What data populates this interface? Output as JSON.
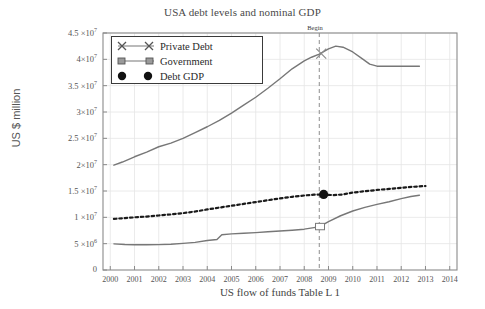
{
  "chart_data": {
    "type": "line",
    "title": "USA debt levels and nominal GDP",
    "xlabel": "US flow of funds Table L 1",
    "ylabel": "US $ million",
    "xlim": [
      1999.7,
      2014.3
    ],
    "ylim": [
      0,
      45000000
    ],
    "grid": true,
    "legend_position": "upper-left",
    "ytick_labels": [
      {
        "value": 45000000,
        "mantissa": "4.5 ×10",
        "exponent": "7"
      },
      {
        "value": 40000000,
        "mantissa": "4×10",
        "exponent": "7"
      },
      {
        "value": 35000000,
        "mantissa": "3.5 ×10",
        "exponent": "7"
      },
      {
        "value": 30000000,
        "mantissa": "3×10",
        "exponent": "7"
      },
      {
        "value": 25000000,
        "mantissa": "2.5 ×10",
        "exponent": "7"
      },
      {
        "value": 20000000,
        "mantissa": "2×10",
        "exponent": "7"
      },
      {
        "value": 15000000,
        "mantissa": "1.5 ×10",
        "exponent": "7"
      },
      {
        "value": 10000000,
        "mantissa": "1 ×10",
        "exponent": "7"
      },
      {
        "value": 5000000,
        "mantissa": "5 ×10",
        "exponent": "6"
      },
      {
        "value": 0,
        "mantissa": "0",
        "exponent": ""
      }
    ],
    "xtick_labels": [
      "2000",
      "2001",
      "2002",
      "2003",
      "2004",
      "2005",
      "2006",
      "2007",
      "2008",
      "2009",
      "2010",
      "2011",
      "2012",
      "2013",
      "2014"
    ],
    "xticks": [
      2000,
      2001,
      2002,
      2003,
      2004,
      2005,
      2006,
      2007,
      2008,
      2009,
      2010,
      2011,
      2012,
      2013,
      2014
    ],
    "annotations": [
      {
        "text": "Begin",
        "x": 2008.62,
        "kind": "vertical-dashed-line"
      }
    ],
    "legend": [
      {
        "label": "Private Debt",
        "marker": "x",
        "style": "solid"
      },
      {
        "label": "Government",
        "marker": "square",
        "style": "solid"
      },
      {
        "label": "Debt GDP",
        "marker": "circle-filled",
        "style": "dotted"
      }
    ],
    "series": [
      {
        "name": "Private Debt",
        "marker": "x",
        "style": "solid",
        "color": "#777777",
        "x": [
          2000.15,
          2000.5,
          2001,
          2001.5,
          2002,
          2002.5,
          2003,
          2003.5,
          2004,
          2004.5,
          2005,
          2005.5,
          2006,
          2006.5,
          2007,
          2007.5,
          2008,
          2008.3,
          2008.62,
          2009,
          2009.3,
          2009.6,
          2010,
          2010.4,
          2010.7,
          2011,
          2011.4,
          2012,
          2012.4,
          2012.75
        ],
        "values": [
          19900000,
          20500000,
          21500000,
          22400000,
          23400000,
          24100000,
          25000000,
          26100000,
          27200000,
          28400000,
          29800000,
          31300000,
          32800000,
          34500000,
          36300000,
          38200000,
          39700000,
          40400000,
          41000000,
          42000000,
          42500000,
          42300000,
          41400000,
          40100000,
          39100000,
          38700000,
          38700000,
          38700000,
          38700000,
          38700000
        ]
      },
      {
        "name": "Government",
        "marker": "square",
        "style": "solid",
        "color": "#777777",
        "x": [
          2000.15,
          2000.6,
          2001,
          2001.5,
          2002,
          2002.5,
          2003,
          2003.5,
          2004,
          2004.4,
          2004.6,
          2005,
          2005.5,
          2006,
          2006.5,
          2007,
          2007.5,
          2008,
          2008.4,
          2008.62,
          2009,
          2009.5,
          2010,
          2010.5,
          2011,
          2011.5,
          2012,
          2012.4,
          2012.75
        ],
        "values": [
          4960000,
          4830000,
          4800000,
          4790000,
          4820000,
          4900000,
          5050000,
          5250000,
          5600000,
          5800000,
          6700000,
          6850000,
          6980000,
          7100000,
          7250000,
          7400000,
          7550000,
          7750000,
          8050000,
          8200000,
          9200000,
          10300000,
          11200000,
          11900000,
          12450000,
          12950000,
          13550000,
          13950000,
          14200000
        ]
      },
      {
        "name": "Debt GDP",
        "marker": "circle-filled",
        "style": "dotted",
        "color": "#1a1a1a",
        "x": [
          2000.15,
          2000.6,
          2001,
          2001.5,
          2002,
          2002.5,
          2003,
          2003.5,
          2004,
          2004.5,
          2005,
          2005.5,
          2006,
          2006.5,
          2007,
          2007.5,
          2008,
          2008.4,
          2008.8,
          2009.2,
          2009.6,
          2010,
          2010.5,
          2011,
          2011.5,
          2012,
          2012.5,
          2013
        ],
        "values": [
          9700000,
          9850000,
          10000000,
          10150000,
          10350000,
          10550000,
          10800000,
          11100000,
          11500000,
          11850000,
          12200000,
          12550000,
          12900000,
          13250000,
          13600000,
          13900000,
          14150000,
          14300000,
          14350000,
          14200000,
          14350000,
          14700000,
          14950000,
          15200000,
          15400000,
          15600000,
          15800000,
          15950000
        ]
      }
    ],
    "highlight_markers": [
      {
        "series": "Private Debt",
        "x": 2008.7,
        "y": 41100000,
        "marker": "x"
      },
      {
        "series": "Government",
        "x": 2008.65,
        "y": 8250000,
        "marker": "square"
      },
      {
        "series": "Debt GDP",
        "x": 2008.8,
        "y": 14350000,
        "marker": "circle-filled"
      }
    ]
  },
  "colors": {
    "line_gray": "#777777",
    "line_dark": "#1a1a1a",
    "grid": "#e4e4e4",
    "frame": "#8a8a8a",
    "text": "#4a4a4a",
    "background": "#ffffff"
  }
}
